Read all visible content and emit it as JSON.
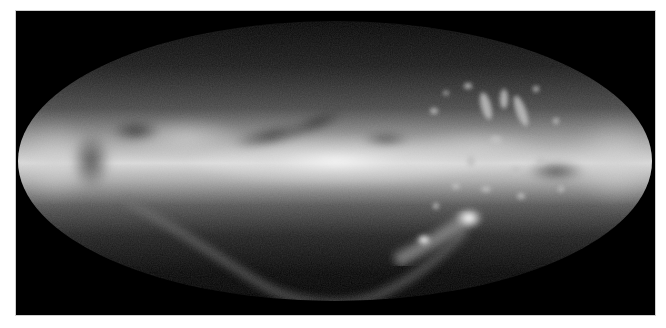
{
  "image": {
    "subject": "all-sky map of the Milky Way galaxy",
    "projection": "elliptical all-sky projection",
    "features": [
      {
        "name": "galactic-plane",
        "description": "bright horizontal band across the center"
      },
      {
        "name": "galactic-bulge",
        "description": "brightest central region"
      },
      {
        "name": "dust-lanes",
        "description": "dark filaments above the plane"
      },
      {
        "name": "large-magellanic-cloud",
        "description": "bright blob lower right"
      },
      {
        "name": "small-magellanic-cloud",
        "description": "smaller bright blob lower right"
      },
      {
        "name": "magellanic-stream",
        "description": "faint arc curving along the bottom"
      },
      {
        "name": "high-velocity-clouds",
        "description": "scattered clumps upper right"
      }
    ],
    "colors": {
      "background": "#000000",
      "page": "#ffffff",
      "band_peak": "#f2f2f2",
      "band_mid": "#8a8a8a",
      "edge": "#2a2a2a"
    }
  }
}
